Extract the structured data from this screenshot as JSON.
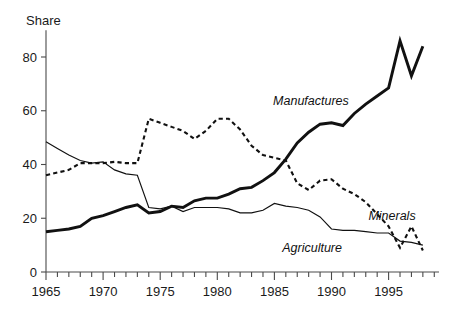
{
  "chart_data": {
    "type": "line",
    "title": "",
    "ylabel": "Share",
    "xlabel": "",
    "ylim": [
      0,
      90
    ],
    "xlim": [
      1965,
      1998
    ],
    "grid": false,
    "legend_position": "inline-annotations",
    "y_ticks": [
      0,
      20,
      40,
      60,
      80
    ],
    "y_tick_labels": [
      "0",
      "20",
      "40",
      "60",
      "80"
    ],
    "x_ticks": [
      1965,
      1970,
      1975,
      1980,
      1985,
      1990,
      1995
    ],
    "x_tick_labels": [
      "1965",
      "1970",
      "1975",
      "1980",
      "1985",
      "1990",
      "1995"
    ],
    "x_minor_tick_interval": 1,
    "x": [
      1965,
      1966,
      1967,
      1968,
      1969,
      1970,
      1971,
      1972,
      1973,
      1974,
      1975,
      1976,
      1977,
      1978,
      1979,
      1980,
      1981,
      1982,
      1983,
      1984,
      1985,
      1986,
      1987,
      1988,
      1989,
      1990,
      1991,
      1992,
      1993,
      1994,
      1995,
      1996,
      1997,
      1998
    ],
    "series": [
      {
        "name": "Manufactures",
        "style": "solid-thick",
        "label": "Manufactures",
        "label_x": 1988.2,
        "label_y": 62,
        "values": [
          15,
          15.5,
          16,
          17,
          20,
          21,
          22.5,
          24,
          25,
          22,
          22.5,
          24.5,
          24,
          26.5,
          27.5,
          27.5,
          29,
          31,
          31.5,
          34,
          37,
          42,
          48,
          52,
          55,
          55.5,
          54.5,
          59,
          62.5,
          65.5,
          68.5,
          86,
          73,
          84
        ]
      },
      {
        "name": "Minerals",
        "style": "dashed",
        "label": "Minerals",
        "label_x": 1995.3,
        "label_y": 19.5,
        "values": [
          36,
          37,
          38,
          40.5,
          40.5,
          40.5,
          41,
          40.5,
          40.5,
          57,
          55.5,
          54,
          52.5,
          49.5,
          52.5,
          57,
          57,
          53,
          47,
          43.5,
          42.5,
          41.5,
          33,
          30.5,
          34,
          34.5,
          31,
          29,
          26,
          21.5,
          17,
          9,
          17,
          8
        ]
      },
      {
        "name": "Agriculture",
        "style": "solid-thin",
        "label": "Agriculture",
        "label_x": 1988.3,
        "label_y": 7.5,
        "values": [
          48.5,
          46,
          43.5,
          41.5,
          40.5,
          41,
          38,
          36.5,
          36,
          24,
          23.5,
          24.5,
          22.5,
          24,
          24,
          24,
          23.5,
          22,
          22,
          23,
          25.5,
          24.5,
          24,
          23,
          20.5,
          16,
          15.5,
          15.5,
          15,
          14.5,
          14.5,
          11.5,
          11,
          10
        ]
      }
    ]
  }
}
